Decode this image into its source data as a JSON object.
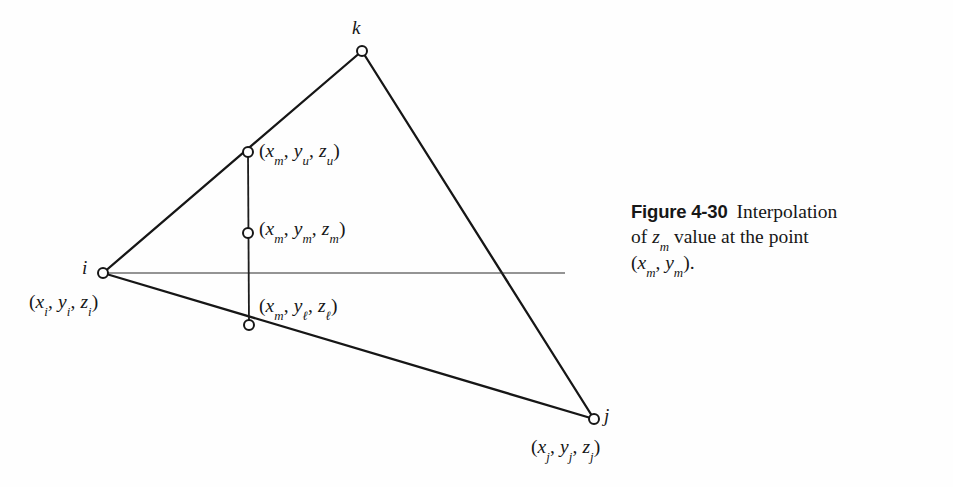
{
  "figure": {
    "background_color": "#fefefe",
    "ink_color": "#161616",
    "caption": {
      "figure_number": "Figure 4-30",
      "line1_text": "Interpolation",
      "line2_prefix": "of ",
      "line2_var": "z",
      "line2_var_sub": "m",
      "line2_suffix": " value at the point",
      "line3_open": "(",
      "line3_var1": "x",
      "line3_var1_sub": "m",
      "line3_sep": ", ",
      "line3_var2": "y",
      "line3_var2_sub": "m",
      "line3_close": ")."
    }
  },
  "diagram": {
    "type": "triangle-interpolation",
    "vertices": [
      {
        "id": "i",
        "label": "i",
        "x": 103,
        "y": 273,
        "coord_open": "(",
        "vars": [
          {
            "name": "x",
            "sub": "i"
          },
          {
            "name": "y",
            "sub": "i"
          },
          {
            "name": "z",
            "sub": "i"
          }
        ],
        "coord_close": ")"
      },
      {
        "id": "k",
        "label": "k",
        "x": 362,
        "y": 51,
        "coord_open": "",
        "vars": [],
        "coord_close": ""
      },
      {
        "id": "j",
        "label": "j",
        "x": 594,
        "y": 419,
        "coord_open": "(",
        "vars": [
          {
            "name": "x",
            "sub": "j"
          },
          {
            "name": "y",
            "sub": "j"
          },
          {
            "name": "z",
            "sub": "j"
          }
        ],
        "coord_close": ")"
      }
    ],
    "interior_points": [
      {
        "id": "upper",
        "x": 248,
        "y": 152,
        "on_edge": "i-k",
        "coord_open": "(",
        "vars": [
          {
            "name": "x",
            "sub": "m"
          },
          {
            "name": "y",
            "sub": "u"
          },
          {
            "name": "z",
            "sub": "u"
          }
        ],
        "coord_close": ")"
      },
      {
        "id": "mid",
        "x": 248,
        "y": 233,
        "on_edge": "vertical",
        "coord_open": "(",
        "vars": [
          {
            "name": "x",
            "sub": "m"
          },
          {
            "name": "y",
            "sub": "m"
          },
          {
            "name": "z",
            "sub": "m"
          }
        ],
        "coord_close": ")"
      },
      {
        "id": "lower",
        "x": 249,
        "y": 325,
        "on_edge": "i-j",
        "coord_open": "(",
        "vars": [
          {
            "name": "x",
            "sub": "m"
          },
          {
            "name": "y",
            "sub": "ℓ"
          },
          {
            "name": "z",
            "sub": "ℓ"
          }
        ],
        "coord_close": ")"
      }
    ],
    "edges": [
      {
        "id": "edge-i-k",
        "from": "i",
        "to": "k",
        "width": 2.3
      },
      {
        "id": "edge-k-j",
        "from": "k",
        "to": "j",
        "width": 2.3
      },
      {
        "id": "edge-i-j",
        "from": "i",
        "to": "j",
        "width": 2.3
      }
    ],
    "vertical_segment": {
      "id": "vertical-line",
      "x": 248,
      "y_top": 152,
      "y_bottom": 325,
      "width": 1.8
    },
    "horizontal_segment": {
      "id": "horizontal-line",
      "x_start": 103,
      "x_end": 565,
      "y": 273,
      "width": 1.2
    },
    "marker": {
      "shape": "open-circle",
      "radius": 5,
      "fill": "#ffffff",
      "stroke": "#161616",
      "stroke_width": 2
    }
  }
}
